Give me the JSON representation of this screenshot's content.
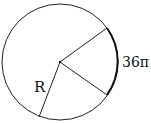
{
  "diagram": {
    "type": "circle-sector",
    "labels": {
      "radius": "R",
      "arc": "36π"
    },
    "circle": {
      "cx": 60,
      "cy": 62,
      "r": 58
    },
    "radii_endpoints": [
      {
        "name": "upper-sector-radius",
        "x": 107,
        "y": 28
      },
      {
        "name": "lower-sector-radius",
        "x": 107,
        "y": 95
      },
      {
        "name": "labeled-radius",
        "x": 39,
        "y": 117
      }
    ],
    "colors": {
      "stroke": "#111111",
      "background": "#ffffff"
    }
  }
}
